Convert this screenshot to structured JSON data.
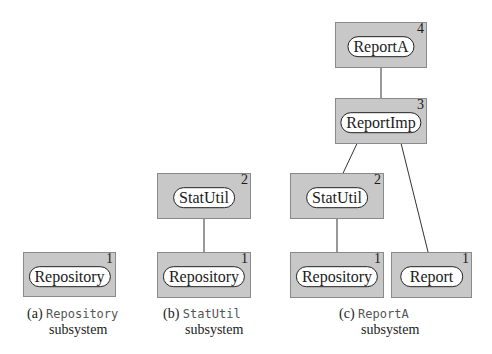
{
  "colors": {
    "box_fill": "#c8c8c8",
    "pill_fill": "#ffffff",
    "line": "#333333"
  },
  "panels": [
    {
      "id": "a",
      "caption": {
        "label": "(a)",
        "name": "Repository",
        "suffix": "subsystem"
      },
      "components": [
        {
          "name": "Repository",
          "level": "1"
        }
      ]
    },
    {
      "id": "b",
      "caption": {
        "label": "(b)",
        "name": "StatUtil",
        "suffix": "subsystem"
      },
      "components": [
        {
          "name": "StatUtil",
          "level": "2"
        },
        {
          "name": "Repository",
          "level": "1"
        }
      ],
      "links": [
        {
          "from": "StatUtil",
          "to": "Repository",
          "type": "open-circle"
        }
      ]
    },
    {
      "id": "c",
      "caption": {
        "label": "(c)",
        "name": "ReportA",
        "suffix": "subsystem"
      },
      "components": [
        {
          "name": "ReportA",
          "level": "4"
        },
        {
          "name": "ReportImp",
          "level": "3"
        },
        {
          "name": "StatUtil",
          "level": "2"
        },
        {
          "name": "Repository",
          "level": "1"
        },
        {
          "name": "Report",
          "level": "1"
        }
      ],
      "links": [
        {
          "from": "ReportA",
          "to": "ReportImp",
          "type": "arrow"
        },
        {
          "from": "ReportImp",
          "to": "StatUtil",
          "type": "filled-circle"
        },
        {
          "from": "StatUtil",
          "to": "Repository",
          "type": "open-circle"
        },
        {
          "from": "ReportImp",
          "to": "Report",
          "type": "arrow"
        }
      ]
    }
  ]
}
